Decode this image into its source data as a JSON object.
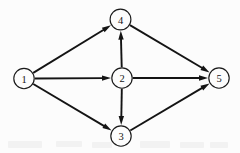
{
  "figure": {
    "background_color": "#fcfcfc",
    "stroke_color": "#141414",
    "width": 240,
    "height": 153
  },
  "chart_data": {
    "type": "diagram",
    "diagram_type": "directed-graph",
    "title": "",
    "nodes": [
      {
        "id": "1",
        "label": "1",
        "cx": 24,
        "cy": 78.5,
        "r": 10.2
      },
      {
        "id": "4",
        "label": "4",
        "cx": 120.5,
        "cy": 19.5,
        "r": 10.4
      },
      {
        "id": "2",
        "label": "2",
        "cx": 122,
        "cy": 78,
        "r": 10.2
      },
      {
        "id": "3",
        "label": "3",
        "cx": 121,
        "cy": 136,
        "r": 10.2
      },
      {
        "id": "5",
        "label": "5",
        "cx": 219,
        "cy": 78,
        "r": 10.2
      }
    ],
    "edges": [
      {
        "from": "1",
        "to": "4",
        "directed": true
      },
      {
        "from": "1",
        "to": "2",
        "directed": true
      },
      {
        "from": "1",
        "to": "3",
        "directed": true
      },
      {
        "from": "2",
        "to": "4",
        "directed": true
      },
      {
        "from": "2",
        "to": "3",
        "directed": true
      },
      {
        "from": "2",
        "to": "5",
        "directed": true
      },
      {
        "from": "4",
        "to": "5",
        "directed": true
      },
      {
        "from": "3",
        "to": "5",
        "directed": true
      }
    ],
    "arrowhead": {
      "length": 9,
      "width": 5.4
    },
    "legend": [],
    "annotations": []
  },
  "artifacts": [
    {
      "x": 8,
      "y": 141,
      "w": 34,
      "h": 7
    },
    {
      "x": 56,
      "y": 141,
      "w": 26,
      "h": 6
    },
    {
      "x": 92,
      "y": 142,
      "w": 20,
      "h": 6
    },
    {
      "x": 140,
      "y": 141,
      "w": 30,
      "h": 7
    },
    {
      "x": 180,
      "y": 142,
      "w": 24,
      "h": 6
    },
    {
      "x": 210,
      "y": 142,
      "w": 18,
      "h": 6
    }
  ]
}
